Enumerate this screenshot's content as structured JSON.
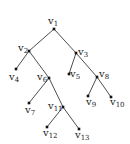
{
  "diagram": {
    "type": "binary-tree",
    "nodes": [
      {
        "id": "v1",
        "base": "v",
        "sub": "1",
        "x": 54,
        "y": 29,
        "lx": 48,
        "ly": 24,
        "ax": "start"
      },
      {
        "id": "v2",
        "base": "v",
        "sub": "2",
        "x": 29,
        "y": 51,
        "lx": 18,
        "ly": 51,
        "ax": "start"
      },
      {
        "id": "v3",
        "base": "v",
        "sub": "3",
        "x": 76,
        "y": 53,
        "lx": 78,
        "ly": 55,
        "ax": "start"
      },
      {
        "id": "v4",
        "base": "v",
        "sub": "4",
        "x": 16,
        "y": 69,
        "lx": 9,
        "ly": 80,
        "ax": "start"
      },
      {
        "id": "v5",
        "base": "v",
        "sub": "5",
        "x": 69,
        "y": 74,
        "lx": 70,
        "ly": 77,
        "ax": "start"
      },
      {
        "id": "v6",
        "base": "v",
        "sub": "6",
        "x": 49,
        "y": 78,
        "lx": 37,
        "ly": 80,
        "ax": "start"
      },
      {
        "id": "v7",
        "base": "v",
        "sub": "7",
        "x": 29,
        "y": 103,
        "lx": 25,
        "ly": 113,
        "ax": "start"
      },
      {
        "id": "v8",
        "base": "v",
        "sub": "8",
        "x": 97,
        "y": 77,
        "lx": 99,
        "ly": 77,
        "ax": "start"
      },
      {
        "id": "v9",
        "base": "v",
        "sub": "9",
        "x": 88,
        "y": 96,
        "lx": 86,
        "ly": 105,
        "ax": "start"
      },
      {
        "id": "v10",
        "base": "v",
        "sub": "10",
        "x": 111,
        "y": 97,
        "lx": 110,
        "ly": 105,
        "ax": "start"
      },
      {
        "id": "v11",
        "base": "v",
        "sub": "11",
        "x": 63,
        "y": 107,
        "lx": 48,
        "ly": 109,
        "ax": "start"
      },
      {
        "id": "v12",
        "base": "v",
        "sub": "12",
        "x": 47,
        "y": 127,
        "lx": 43,
        "ly": 136,
        "ax": "start"
      },
      {
        "id": "v13",
        "base": "v",
        "sub": "13",
        "x": 79,
        "y": 129,
        "lx": 75,
        "ly": 138,
        "ax": "start"
      }
    ],
    "edges": [
      [
        "v1",
        "v2"
      ],
      [
        "v1",
        "v3"
      ],
      [
        "v2",
        "v4"
      ],
      [
        "v2",
        "v6"
      ],
      [
        "v3",
        "v5"
      ],
      [
        "v3",
        "v8"
      ],
      [
        "v6",
        "v7"
      ],
      [
        "v6",
        "v11"
      ],
      [
        "v8",
        "v9"
      ],
      [
        "v8",
        "v10"
      ],
      [
        "v11",
        "v12"
      ],
      [
        "v11",
        "v13"
      ]
    ],
    "colors": {
      "edge": "#3a3a3a",
      "node": "#111111",
      "label": "#222222",
      "background": "#ffffff"
    }
  }
}
